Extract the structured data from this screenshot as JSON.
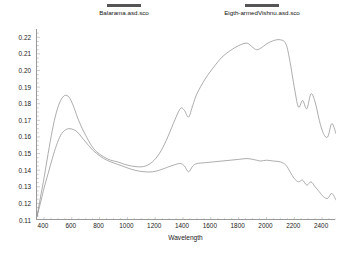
{
  "chart_data": {
    "type": "line",
    "title": "",
    "xlabel": "Wavelength",
    "ylabel": "Reflectance",
    "xlim": [
      350,
      2500
    ],
    "ylim": [
      0.11,
      0.225
    ],
    "xticks": [
      400,
      600,
      800,
      1000,
      1200,
      1400,
      1600,
      1800,
      2000,
      2200,
      2400
    ],
    "yticks": [
      0.11,
      0.12,
      0.13,
      0.14,
      0.15,
      0.16,
      0.17,
      0.18,
      0.19,
      0.2,
      0.21,
      0.22
    ],
    "ytick_labels": [
      "0.11",
      "0.12",
      "0.13",
      "0.14",
      "0.15",
      "0.16",
      "0.17",
      "0.18",
      "0.19",
      "0.20",
      "0.21",
      "0.22"
    ],
    "xtick_labels": [
      "400",
      "600",
      "800",
      "1000",
      "1200",
      "1400",
      "1600",
      "1800",
      "2000",
      "2200",
      "2400"
    ],
    "grid": false,
    "legend_position": "top",
    "series": [
      {
        "name": "Balarama.asd.sco",
        "color": "#8a8a8a",
        "x": [
          350,
          380,
          400,
          430,
          460,
          490,
          520,
          550,
          580,
          610,
          640,
          670,
          700,
          740,
          780,
          830,
          880,
          930,
          980,
          1030,
          1080,
          1130,
          1180,
          1230,
          1280,
          1330,
          1380,
          1410,
          1440,
          1470,
          1500,
          1560,
          1620,
          1680,
          1740,
          1800,
          1860,
          1900,
          1930,
          1960,
          2000,
          2050,
          2100,
          2140,
          2170,
          2200,
          2230,
          2260,
          2290,
          2320,
          2350,
          2380,
          2410,
          2440,
          2470,
          2500
        ],
        "y": [
          0.112,
          0.126,
          0.135,
          0.15,
          0.164,
          0.175,
          0.182,
          0.185,
          0.184,
          0.179,
          0.172,
          0.166,
          0.161,
          0.155,
          0.151,
          0.148,
          0.146,
          0.145,
          0.1435,
          0.1425,
          0.142,
          0.1425,
          0.145,
          0.15,
          0.158,
          0.168,
          0.177,
          0.176,
          0.172,
          0.179,
          0.186,
          0.195,
          0.202,
          0.208,
          0.212,
          0.215,
          0.2165,
          0.214,
          0.2125,
          0.2135,
          0.216,
          0.218,
          0.2185,
          0.216,
          0.205,
          0.19,
          0.178,
          0.182,
          0.177,
          0.186,
          0.181,
          0.17,
          0.162,
          0.16,
          0.168,
          0.162
        ]
      },
      {
        "name": "Eigth-armedVishnu.asd.sco",
        "color": "#8a8a8a",
        "x": [
          350,
          380,
          400,
          430,
          460,
          490,
          520,
          550,
          580,
          610,
          640,
          670,
          700,
          740,
          780,
          830,
          880,
          930,
          980,
          1030,
          1080,
          1130,
          1180,
          1230,
          1280,
          1330,
          1380,
          1410,
          1440,
          1470,
          1500,
          1560,
          1620,
          1680,
          1740,
          1800,
          1860,
          1900,
          1930,
          1960,
          2000,
          2050,
          2100,
          2140,
          2170,
          2200,
          2230,
          2260,
          2290,
          2320,
          2350,
          2380,
          2410,
          2440,
          2470,
          2500
        ],
        "y": [
          0.112,
          0.122,
          0.129,
          0.138,
          0.147,
          0.155,
          0.161,
          0.164,
          0.165,
          0.1645,
          0.163,
          0.16,
          0.157,
          0.153,
          0.15,
          0.147,
          0.145,
          0.1435,
          0.142,
          0.1405,
          0.1395,
          0.139,
          0.139,
          0.14,
          0.1415,
          0.143,
          0.144,
          0.1425,
          0.139,
          0.1425,
          0.144,
          0.1445,
          0.145,
          0.1455,
          0.146,
          0.1465,
          0.147,
          0.1465,
          0.146,
          0.1455,
          0.146,
          0.1455,
          0.145,
          0.143,
          0.139,
          0.135,
          0.133,
          0.134,
          0.131,
          0.133,
          0.13,
          0.127,
          0.124,
          0.123,
          0.126,
          0.122
        ]
      }
    ]
  },
  "legend": [
    {
      "label": "Balarama.asd.sco",
      "swatch_color": "#555555"
    },
    {
      "label": "Eigth-armedVishnu.asd.sco",
      "swatch_color": "#555555"
    }
  ],
  "axes": {
    "x_title": "Wavelength",
    "y_title": "Reflectance"
  }
}
